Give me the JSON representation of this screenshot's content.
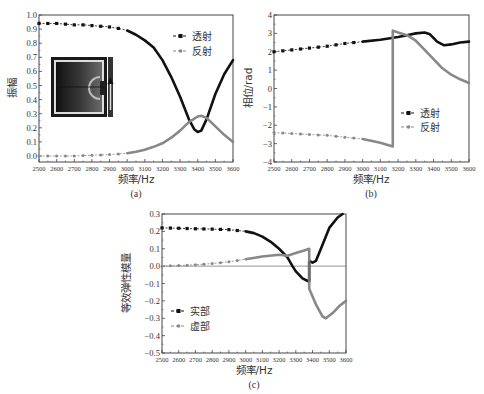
{
  "chart_data": [
    {
      "id": "a",
      "type": "line",
      "caption": "(a)",
      "xlabel": "频率/Hz",
      "ylabel": "振幅",
      "xlim": [
        2500,
        3600
      ],
      "ylim": [
        0.0,
        1.0
      ],
      "xticks": [
        2500,
        2600,
        2700,
        2800,
        2900,
        3000,
        3100,
        3200,
        3300,
        3400,
        3500,
        3600
      ],
      "yticks": [
        "0.0",
        "0.1",
        "0.2",
        "0.3",
        "0.4",
        "0.5",
        "0.6",
        "0.7",
        "0.8",
        "0.9",
        "1.0"
      ],
      "legend": [
        "透射",
        "反射"
      ],
      "legend_position": "upper right",
      "inset": "field distribution image with arrow",
      "series": [
        {
          "name": "透射",
          "color": "#111111",
          "x": [
            2500,
            2550,
            2600,
            2650,
            2700,
            2750,
            2800,
            2850,
            2900,
            2950,
            3000,
            3050,
            3100,
            3150,
            3200,
            3250,
            3300,
            3350,
            3380,
            3400,
            3420,
            3450,
            3500,
            3550,
            3600
          ],
          "y": [
            0.94,
            0.94,
            0.94,
            0.935,
            0.93,
            0.93,
            0.925,
            0.92,
            0.915,
            0.905,
            0.89,
            0.86,
            0.82,
            0.77,
            0.68,
            0.56,
            0.42,
            0.26,
            0.19,
            0.17,
            0.18,
            0.26,
            0.44,
            0.58,
            0.68
          ]
        },
        {
          "name": "反射",
          "color": "#888888",
          "x": [
            2500,
            2550,
            2600,
            2650,
            2700,
            2750,
            2800,
            2850,
            2900,
            2950,
            3000,
            3050,
            3100,
            3150,
            3200,
            3250,
            3300,
            3350,
            3400,
            3420,
            3450,
            3500,
            3550,
            3600
          ],
          "y": [
            0.0,
            0.0,
            0.0,
            0.0,
            0.0,
            0.003,
            0.005,
            0.007,
            0.01,
            0.015,
            0.02,
            0.03,
            0.045,
            0.065,
            0.09,
            0.13,
            0.18,
            0.24,
            0.28,
            0.285,
            0.27,
            0.21,
            0.15,
            0.1
          ]
        }
      ]
    },
    {
      "id": "b",
      "type": "line",
      "caption": "(b)",
      "xlabel": "频率/Hz",
      "ylabel": "相位/rad",
      "xlim": [
        2500,
        3600
      ],
      "ylim": [
        -4,
        4
      ],
      "xticks": [
        2500,
        2600,
        2700,
        2800,
        2900,
        3000,
        3100,
        3200,
        3300,
        3400,
        3500,
        3600
      ],
      "yticks": [
        "−4",
        "−3",
        "−2",
        "−1",
        "0",
        "1",
        "2",
        "3",
        "4"
      ],
      "legend": [
        "透射",
        "反射"
      ],
      "legend_position": "center right",
      "series": [
        {
          "name": "透射",
          "color": "#111111",
          "x": [
            2500,
            2600,
            2700,
            2800,
            2900,
            3000,
            3100,
            3200,
            3250,
            3300,
            3350,
            3380,
            3420,
            3460,
            3500,
            3550,
            3600
          ],
          "y": [
            2.0,
            2.1,
            2.2,
            2.3,
            2.45,
            2.55,
            2.65,
            2.8,
            2.9,
            3.0,
            3.05,
            2.95,
            2.55,
            2.35,
            2.4,
            2.5,
            2.55
          ]
        },
        {
          "name": "反射",
          "color": "#888888",
          "x": [
            2500,
            2600,
            2700,
            2800,
            2900,
            3000,
            3100,
            3170,
            3170,
            3200,
            3250,
            3300,
            3350,
            3400,
            3450,
            3500,
            3550,
            3600
          ],
          "y": [
            -2.4,
            -2.45,
            -2.5,
            -2.55,
            -2.65,
            -2.75,
            -2.95,
            -3.15,
            3.15,
            3.05,
            2.9,
            2.6,
            2.1,
            1.6,
            1.1,
            0.75,
            0.5,
            0.3
          ]
        }
      ]
    },
    {
      "id": "c",
      "type": "line",
      "caption": "(c)",
      "xlabel": "频率/Hz",
      "ylabel": "等效弹性模量",
      "xlim": [
        2500,
        3600
      ],
      "ylim": [
        -0.5,
        0.3
      ],
      "xticks": [
        2500,
        2600,
        2700,
        2800,
        2900,
        3000,
        3100,
        3200,
        3300,
        3400,
        3500,
        3600
      ],
      "yticks": [
        "−0.5",
        "−0.4",
        "−0.3",
        "−0.2",
        "−0.1",
        "0.0",
        "0.1",
        "0.2",
        "0.3"
      ],
      "legend": [
        "实部",
        "虚部"
      ],
      "legend_position": "lower left",
      "series": [
        {
          "name": "实部",
          "color": "#111111",
          "x": [
            2500,
            2600,
            2700,
            2800,
            2900,
            3000,
            3050,
            3100,
            3150,
            3200,
            3250,
            3280,
            3300,
            3340,
            3380,
            3380,
            3400,
            3420,
            3450,
            3500,
            3550,
            3580
          ],
          "y": [
            0.22,
            0.218,
            0.215,
            0.213,
            0.21,
            0.2,
            0.19,
            0.17,
            0.14,
            0.1,
            0.05,
            0.0,
            -0.03,
            -0.07,
            -0.09,
            0.03,
            0.02,
            0.03,
            0.1,
            0.22,
            0.28,
            0.3
          ]
        },
        {
          "name": "虚部",
          "color": "#888888",
          "x": [
            2500,
            2600,
            2700,
            2800,
            2900,
            3000,
            3100,
            3200,
            3250,
            3300,
            3350,
            3380,
            3380,
            3420,
            3460,
            3480,
            3520,
            3560,
            3600
          ],
          "y": [
            0.0,
            0.003,
            0.008,
            0.015,
            0.025,
            0.04,
            0.055,
            0.065,
            0.06,
            0.075,
            0.09,
            0.1,
            -0.13,
            -0.22,
            -0.29,
            -0.3,
            -0.27,
            -0.23,
            -0.2
          ]
        }
      ]
    }
  ],
  "panels": {
    "a": {
      "caption": "(a)",
      "xlabel": "频率/Hz",
      "ylabel": "振幅",
      "legend1": "透射",
      "legend2": "反射"
    },
    "b": {
      "caption": "(b)",
      "xlabel": "频率/Hz",
      "ylabel": "相位/rad",
      "legend1": "透射",
      "legend2": "反射"
    },
    "c": {
      "caption": "(c)",
      "xlabel": "频率/Hz",
      "ylabel": "等效弹性模量",
      "legend1": "实部",
      "legend2": "虚部"
    }
  }
}
